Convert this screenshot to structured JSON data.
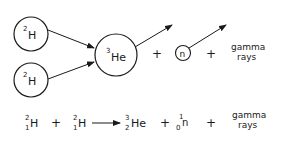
{
  "diagram": {
    "nodes": [
      {
        "id": "deuterium-1",
        "mass": "2",
        "symbol": "H"
      },
      {
        "id": "deuterium-2",
        "mass": "2",
        "symbol": "H"
      },
      {
        "id": "helium-3",
        "mass": "3",
        "symbol": "He"
      },
      {
        "id": "neutron",
        "symbol": "n"
      }
    ],
    "plus": "+",
    "gamma_line1": "gamma",
    "gamma_line2": "rays"
  },
  "equation": {
    "terms": [
      {
        "mass": "2",
        "atomic": "1",
        "symbol": "H"
      },
      {
        "mass": "2",
        "atomic": "1",
        "symbol": "H"
      },
      {
        "mass": "3",
        "atomic": "2",
        "symbol": "He"
      },
      {
        "mass": "1",
        "atomic": "0",
        "symbol": "n"
      }
    ],
    "plus": "+",
    "gamma_line1": "gamma",
    "gamma_line2": "rays"
  },
  "colors": {
    "ink": "#1a1a1a",
    "background": "#ffffff"
  }
}
